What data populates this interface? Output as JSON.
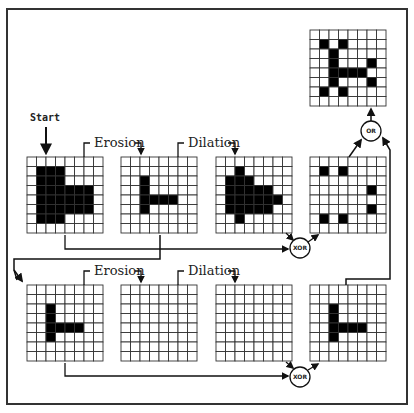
{
  "colors": {
    "ink": "#111111",
    "cell_on": "#000000",
    "cell_off": "#ffffff",
    "grid_line": "#333333"
  },
  "labels": {
    "start": "Start",
    "erosion_1": "Erosion",
    "dilation_1": "Dilation",
    "erosion_2": "Erosion",
    "dilation_2": "Dilation",
    "xor_1": "XOR",
    "xor_2": "XOR",
    "or": "OR"
  },
  "grid_size": 8,
  "grids": {
    "start": [
      "00000000",
      "01110000",
      "01110000",
      "01111110",
      "01111110",
      "01111110",
      "01110000",
      "00000000"
    ],
    "erosion_1": [
      "00000000",
      "00000000",
      "00100000",
      "00100000",
      "00111100",
      "00100000",
      "00000000",
      "00000000"
    ],
    "dilation_1": [
      "00000000",
      "00100000",
      "01110000",
      "01111100",
      "01111110",
      "01111100",
      "00100000",
      "00000000"
    ],
    "xor_1_result": [
      "00000000",
      "01010000",
      "00000000",
      "00000010",
      "00000000",
      "00000010",
      "01010000",
      "00000000"
    ],
    "row2_input": [
      "00000000",
      "00000000",
      "00100000",
      "00100000",
      "00111100",
      "00100000",
      "00000000",
      "00000000"
    ],
    "erosion_2": [
      "00000000",
      "00000000",
      "00000000",
      "00000000",
      "00000000",
      "00000000",
      "00000000",
      "00000000"
    ],
    "dilation_2": [
      "00000000",
      "00000000",
      "00000000",
      "00000000",
      "00000000",
      "00000000",
      "00000000",
      "00000000"
    ],
    "xor_2_result": [
      "00000000",
      "00000000",
      "00100000",
      "00100000",
      "00111100",
      "00100000",
      "00000000",
      "00000000"
    ],
    "or_result": [
      "00000000",
      "01010000",
      "00100000",
      "00100010",
      "00111100",
      "00100010",
      "01010000",
      "00000000"
    ]
  }
}
